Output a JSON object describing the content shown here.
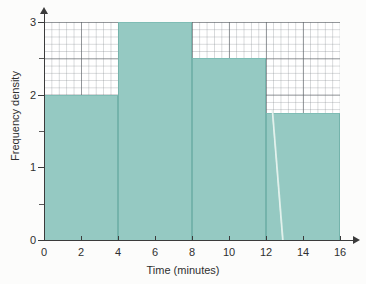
{
  "chart_data": {
    "type": "bar",
    "title": "",
    "subtitle": "",
    "xlabel": "Time (minutes)",
    "ylabel": "Frequency density",
    "xlim": [
      0,
      16
    ],
    "ylim": [
      0,
      3
    ],
    "grid": true,
    "legend": "none",
    "bin_edges": [
      0,
      4,
      8,
      12,
      16
    ],
    "categories": [
      "0-4",
      "4-8",
      "8-12",
      "12-16"
    ],
    "values": [
      2,
      3,
      2.5,
      1.75
    ],
    "bars": [
      {
        "label": "0-4",
        "x0": 0,
        "x1": 4,
        "height": 2
      },
      {
        "label": "4-8",
        "x0": 4,
        "x1": 8,
        "height": 3
      },
      {
        "label": "8-12",
        "x0": 8,
        "x1": 12,
        "height": 2.5
      },
      {
        "label": "12-16",
        "x0": 12,
        "x1": 16,
        "height": 1.75
      }
    ],
    "x_ticks": [
      0,
      2,
      4,
      6,
      8,
      10,
      12,
      14,
      16
    ],
    "x_tick_labels": [
      "0",
      "2",
      "4",
      "6",
      "8",
      "10",
      "12",
      "14",
      "16"
    ],
    "y_ticks": [
      0,
      1,
      2,
      3
    ],
    "y_tick_labels": [
      "0",
      "1",
      "2",
      "3"
    ],
    "y_minor_ticks": [
      0.5,
      1.5,
      2.5
    ],
    "colors": {
      "bar_fill": "#95c9c2",
      "bar_edge": "#74b3ab",
      "axis": "#3b3b3b",
      "grid_major": "#5a5f64",
      "grid_minor": "#787e84",
      "background": "#ffffff",
      "text": "#2f2f2f"
    }
  },
  "axes": {
    "x_title": "Time (minutes)",
    "y_title": "Frequency density"
  }
}
